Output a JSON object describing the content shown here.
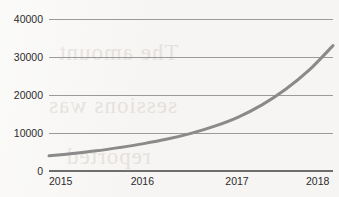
{
  "chart_data": {
    "type": "line",
    "title": "",
    "subtitle": "",
    "xlabel": "",
    "ylabel": "",
    "x": [
      "2015",
      "2016",
      "2017",
      "2018"
    ],
    "xticklabels": [
      "2015",
      "2016",
      "2017",
      "2018"
    ],
    "yticklabels": [
      "0",
      "10000",
      "20000",
      "30000",
      "40000"
    ],
    "yticks": [
      0,
      10000,
      20000,
      30000,
      40000
    ],
    "ylim": [
      0,
      40000
    ],
    "xlim": [
      2015,
      2018
    ],
    "grid": "horizontal",
    "legend": "none",
    "series": [
      {
        "name": "growth",
        "color": "#8a8a8a",
        "line_width": 3,
        "points": [
          {
            "x": 2015.0,
            "y": 4000
          },
          {
            "x": 2015.25,
            "y": 4600
          },
          {
            "x": 2015.5,
            "y": 5300
          },
          {
            "x": 2015.75,
            "y": 6200
          },
          {
            "x": 2016.0,
            "y": 7200
          },
          {
            "x": 2016.25,
            "y": 8400
          },
          {
            "x": 2016.5,
            "y": 9900
          },
          {
            "x": 2016.75,
            "y": 11800
          },
          {
            "x": 2017.0,
            "y": 14200
          },
          {
            "x": 2017.25,
            "y": 17400
          },
          {
            "x": 2017.5,
            "y": 21500
          },
          {
            "x": 2017.75,
            "y": 26600
          },
          {
            "x": 2018.0,
            "y": 33000
          }
        ]
      }
    ],
    "annotations": [
      {
        "kind": "crossing",
        "value": 10000,
        "at_x": 2016.52
      },
      {
        "kind": "crossing",
        "value": 20000,
        "at_x": 2017.42
      }
    ]
  },
  "colors": {
    "page_background": "#f6f5f3",
    "gridline": "#9a9a9a",
    "baseline": "#6e6e6e",
    "curve": "#8a8a8a",
    "label_text": "#2b2b2b",
    "ghost_text": "#cfc6c0"
  },
  "ghost_text": {
    "line1": "The amount",
    "line2": "sessions was",
    "line3": "reported"
  }
}
